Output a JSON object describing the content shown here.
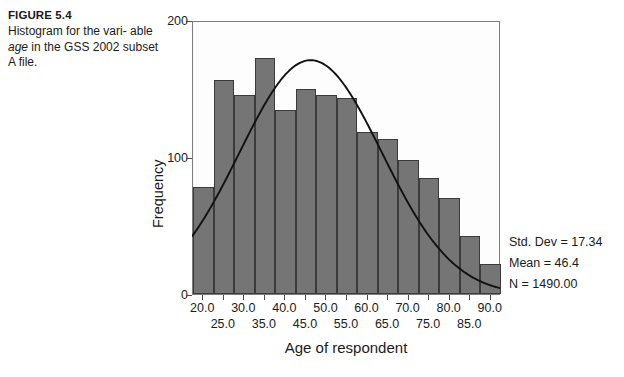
{
  "caption": {
    "figure_label": "FIGURE 5.4",
    "line1": "Histogram for the vari-",
    "line2_pre": "able ",
    "line2_ital": "age",
    "line2_post": " in the GSS",
    "line3": "2002 subset A file."
  },
  "stats": {
    "std_dev": "Std. Dev = 17.34",
    "mean": "Mean = 46.4",
    "n": "N = 1490.00"
  },
  "colors": {
    "bar_fill": "#757575",
    "bar_edge": "#3b3b3b",
    "frame": "#7c7c7c",
    "curve": "#111111"
  },
  "chart_data": {
    "type": "bar",
    "title": "",
    "xlabel": "Age of respondent",
    "ylabel": "Frequency",
    "ylim": [
      0,
      200
    ],
    "xlim": [
      17.5,
      92.5
    ],
    "grid": false,
    "legend": null,
    "bin_width": 5,
    "categories": [
      "17.5-22.5",
      "22.5-27.5",
      "27.5-32.5",
      "32.5-37.5",
      "37.5-42.5",
      "42.5-47.5",
      "47.5-52.5",
      "52.5-57.5",
      "57.5-62.5",
      "62.5-67.5",
      "67.5-72.5",
      "72.5-77.5",
      "77.5-82.5",
      "82.5-87.5",
      "87.5-92.5"
    ],
    "bin_centers": [
      20.0,
      25.0,
      30.0,
      35.0,
      40.0,
      45.0,
      50.0,
      55.0,
      60.0,
      65.0,
      70.0,
      75.0,
      80.0,
      85.0,
      90.0
    ],
    "values": [
      78,
      156,
      145,
      172,
      134,
      150,
      145,
      143,
      118,
      113,
      98,
      85,
      70,
      42,
      22
    ],
    "yticks": [
      0,
      100,
      200
    ],
    "xticks_row1": [
      "20.0",
      "30.0",
      "40.0",
      "50.0",
      "60.0",
      "70.0",
      "80.0",
      "90.0"
    ],
    "xticks_row1_values": [
      20.0,
      30.0,
      40.0,
      50.0,
      60.0,
      70.0,
      80.0,
      90.0
    ],
    "xticks_row2": [
      "25.0",
      "35.0",
      "45.0",
      "55.0",
      "65.0",
      "75.0",
      "85.0"
    ],
    "xticks_row2_values": [
      25.0,
      35.0,
      45.0,
      55.0,
      65.0,
      75.0,
      85.0
    ],
    "overlay": {
      "type": "normal-curve",
      "mean": 46.4,
      "std_dev": 17.34,
      "n": 1490,
      "peak_value": 171
    },
    "annotations": [
      "Std. Dev = 17.34",
      "Mean = 46.4",
      "N = 1490.00"
    ]
  }
}
